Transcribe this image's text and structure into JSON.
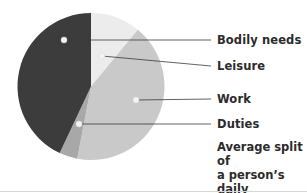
{
  "chart_data": {
    "type": "pie",
    "start_angle_deg": 0,
    "direction": "clockwise",
    "slices": [
      {
        "label": "Leisure",
        "value": 11,
        "color": "#ececec"
      },
      {
        "label": "Work",
        "value": 42,
        "color": "#c9c9c9"
      },
      {
        "label": "Duties",
        "value": 4,
        "color": "#a8a8a8"
      },
      {
        "label": "Bodily needs",
        "value": 43,
        "color": "#3c3c3c"
      }
    ],
    "legend_position": "right",
    "annotation_style": "leader lines from dots to labels"
  },
  "labels": {
    "bodily_needs": "Bodily needs",
    "leisure": "Leisure",
    "work": "Work",
    "duties": "Duties"
  },
  "caption": {
    "line1": "Average split of",
    "line2": "a person’s daily",
    "line3": "activities"
  }
}
